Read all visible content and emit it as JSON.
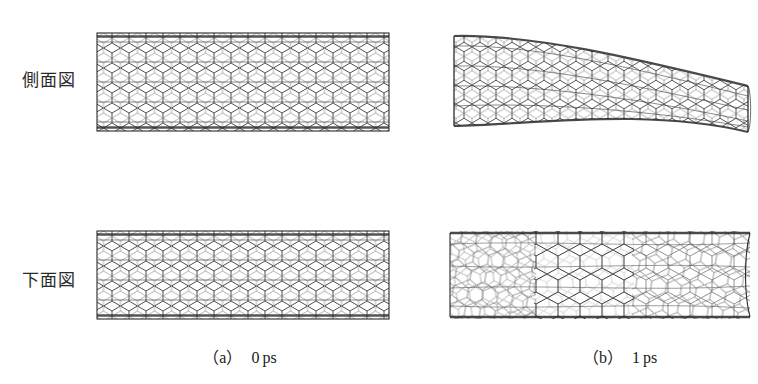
{
  "figure": {
    "background_color": "#ffffff",
    "line_color": "#333333",
    "row_labels": [
      {
        "key": "side_view",
        "label": "側面図",
        "meaning": "side-view"
      },
      {
        "key": "bottom_view",
        "label": "下面図",
        "meaning": "bottom-view"
      }
    ],
    "captions": [
      {
        "key": "a",
        "paren": "（a）",
        "value": "0",
        "unit": "ps"
      },
      {
        "key": "b",
        "paren": "（b）",
        "value": "1",
        "unit": "ps"
      }
    ],
    "panels": [
      {
        "key": "a_side",
        "row": "side_view",
        "column": "a",
        "subject": "carbon-nanotube",
        "state": "straight",
        "description": "undeformed straight nanotube, regular hexagonal lattice"
      },
      {
        "key": "a_bottom",
        "row": "bottom_view",
        "column": "a",
        "subject": "carbon-nanotube",
        "state": "straight",
        "description": "undeformed straight nanotube seen from below"
      },
      {
        "key": "b_side",
        "row": "side_view",
        "column": "b",
        "subject": "carbon-nanotube",
        "state": "bent",
        "description": "nanotube bent downward toward the right end after 1 ps"
      },
      {
        "key": "b_bottom",
        "row": "bottom_view",
        "column": "b",
        "subject": "carbon-nanotube",
        "state": "distorted",
        "description": "nanotube seen from below showing distorted, stretched hexagonal lattice"
      }
    ],
    "bottom_clipped_text": ""
  }
}
